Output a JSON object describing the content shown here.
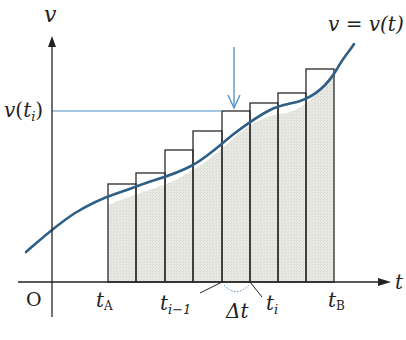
{
  "diagram": {
    "type": "riemann-sum-velocity-time",
    "axes": {
      "y_label": "v",
      "x_label": "t",
      "origin_label": "O"
    },
    "curve_label": "v = v(t)",
    "level_label": {
      "main": "v",
      "open": "(",
      "t": "t",
      "sub": "i",
      "close": ")"
    },
    "tick_labels": {
      "tA": {
        "main": "t",
        "sub": "A"
      },
      "ti_minus_1": {
        "main": "t",
        "sub": "i−1"
      },
      "delta_t": "Δt",
      "ti": {
        "main": "t",
        "sub": "i"
      },
      "tB": {
        "main": "t",
        "sub": "B"
      }
    },
    "rectangles": {
      "count": 8,
      "left_edges_px": [
        108,
        136,
        165,
        193,
        222,
        250,
        278,
        306
      ],
      "right_edge_px": 334,
      "tops_px": [
        184,
        173,
        150,
        131,
        111,
        103,
        93,
        69
      ],
      "highlighted_index": 4
    },
    "colors": {
      "curve": "#2e5f86",
      "highlight_line": "#4a8fc8",
      "fill": "#e6e6e0",
      "axis": "#222222"
    },
    "caption": ""
  }
}
